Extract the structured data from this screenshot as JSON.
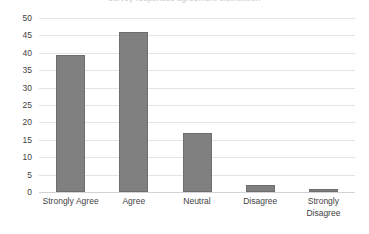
{
  "chart": {
    "title_partial": "survey responses agreement distribution",
    "axis": {
      "y_ticks": [
        "50",
        "45",
        "40",
        "35",
        "30",
        "25",
        "20",
        "15",
        "10",
        "5",
        "0"
      ]
    }
  },
  "chart_data": {
    "type": "bar",
    "title": "",
    "xlabel": "",
    "ylabel": "",
    "categories": [
      "Strongly Agree",
      "Agree",
      "Neutral",
      "Disagree",
      "Strongly Disagree"
    ],
    "values": [
      39.5,
      46,
      17,
      2,
      1
    ],
    "ylim": [
      0,
      50
    ],
    "ytick_step": 5,
    "grid": true,
    "legend": false,
    "bar_color": "#808080",
    "bar_edge_color": "#6e6e6e",
    "gridline_color": "#e4e4e6",
    "background_color": "#ffffff"
  }
}
